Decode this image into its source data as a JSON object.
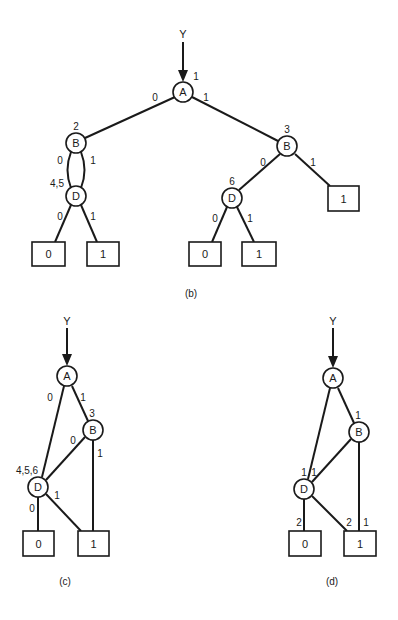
{
  "diagrams": {
    "b": {
      "caption": "(b)",
      "input_label": "Y",
      "nodes": {
        "A": {
          "label": "A",
          "annot": "1"
        },
        "B_left": {
          "label": "B",
          "annot": "2"
        },
        "D_left": {
          "label": "D",
          "annot": "4,5"
        },
        "B_right": {
          "label": "B",
          "annot": "3"
        },
        "D_right": {
          "label": "D",
          "annot": "6"
        }
      },
      "terminals": [
        "0",
        "1",
        "0",
        "1",
        "1"
      ],
      "edges": {
        "A_to_Bl": "0",
        "A_to_Br": "1",
        "Bl_to_Dl_0": "0",
        "Bl_to_Dl_1": "1",
        "Dl_to_T0": "0",
        "Dl_to_T1": "1",
        "Br_to_Dr": "0",
        "Br_to_T1": "1",
        "Dr_to_T0": "0",
        "Dr_to_T1": "1"
      }
    },
    "c": {
      "caption": "(c)",
      "input_label": "Y",
      "nodes": {
        "A": {
          "label": "A"
        },
        "B": {
          "label": "B",
          "annot": "3"
        },
        "D": {
          "label": "D",
          "annot": "4,5,6"
        }
      },
      "terminals": [
        "0",
        "1"
      ],
      "edges": {
        "A_to_D": "0",
        "A_to_B": "1",
        "B_to_D": "0",
        "B_to_T1": "1",
        "D_to_T0": "0",
        "D_to_T1": "1"
      }
    },
    "d": {
      "caption": "(d)",
      "input_label": "Y",
      "nodes": {
        "A": {
          "label": "A"
        },
        "B": {
          "label": "B",
          "annot": "1"
        },
        "D": {
          "label": "D",
          "annot_left": "1",
          "annot_right": "1"
        }
      },
      "terminals": [
        "0",
        "1"
      ],
      "edges": {
        "D_to_T0": "2",
        "D_to_T1": "2",
        "B_to_T1": "1"
      }
    }
  }
}
